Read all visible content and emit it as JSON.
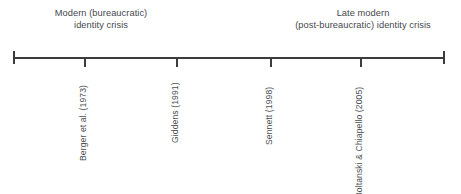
{
  "figure": {
    "type": "timeline",
    "width": 461,
    "height": 194,
    "background_color": "#ffffff",
    "axis_color": "#3c3c3c",
    "text_color": "#45494d"
  },
  "eras": [
    {
      "name": "modern",
      "line1": "Modern (bureaucratic)",
      "line2": "identity crisis"
    },
    {
      "name": "late-modern",
      "line1": "Late modern",
      "line2": "(post-bureaucratic) identity crisis"
    }
  ],
  "axis": {
    "start_x": 13,
    "end_x": 445,
    "y": 57,
    "has_end_caps": true
  },
  "references": [
    {
      "label": "Berger et al. (1973)",
      "year": 1973,
      "x": 84,
      "tick": true
    },
    {
      "label": "Giddens (1991)",
      "year": 1991,
      "x": 176,
      "tick": true
    },
    {
      "label": "Sennett (1998)",
      "year": 1998,
      "x": 270,
      "tick": true
    },
    {
      "label": "Boltanski & Chiapello (2005)",
      "year": 2005,
      "x": 360,
      "tick": true
    }
  ]
}
